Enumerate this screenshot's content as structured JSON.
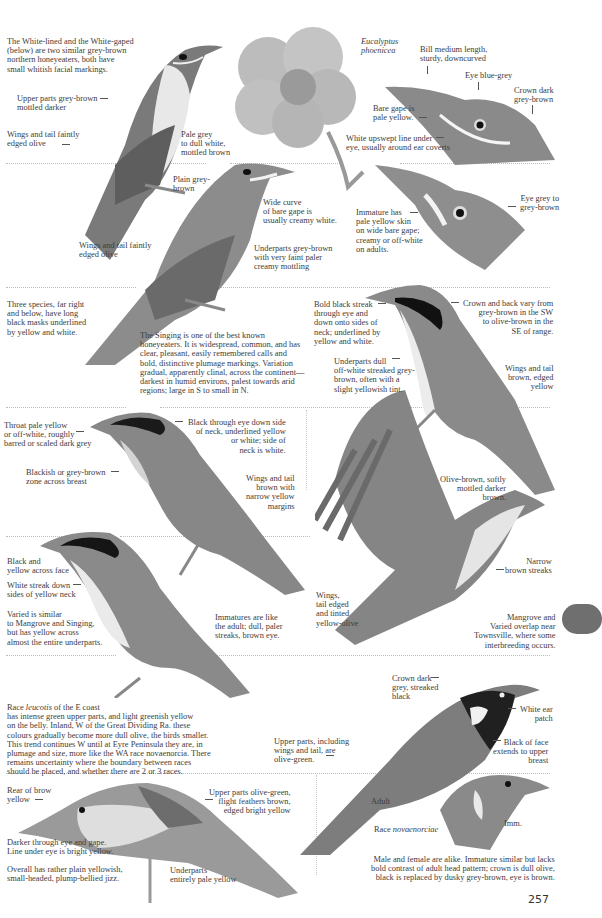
{
  "page": {
    "number": "257",
    "thumb_tab_color": "#6f6f6f"
  },
  "plant": {
    "label_genus": "Eucalyptus",
    "label_species": "phoenicea"
  },
  "white_lined": {
    "intro": "The White-lined and the White-gaped\n(below) are two similar grey-brown\nnorthern honeyeaters, both have\nsmall whitish facial markings.",
    "upperparts": "Upper parts grey-brown\nmottled darker",
    "wings": "Wings and tail faintly\nedged olive",
    "underparts": "Pale grey\nto dull white,\nmottled brown",
    "bill": "Bill medium length,\nsturdy, downcurved",
    "eye": "Eye blue-grey",
    "crown": "Crown dark\ngrey-brown",
    "gape": "Bare gape is\npale yellow.",
    "upswept": "White upswept line under\neye, usually around ear coverts"
  },
  "white_gaped": {
    "plain": "Plain grey-\nbrown",
    "gape_curve": "Wide curve\nof bare gape is\nusually creamy white.",
    "wings": "Wings and tail faintly\nedged olive",
    "underparts": "Underparts grey-brown\nwith very faint paler\ncreamy mottling",
    "immature": "Immature has\npale yellow skin\non wide bare gape;\ncreamy or off-white\non adults.",
    "eye": "Eye grey to\ngrey-brown"
  },
  "singing": {
    "three_species": "Three species, far right\nand below, have long\nblack masks underlined\nby yellow and white.",
    "description": "The Singing is one of the best known\nhoneyeaters.  It is widespread, common, and has\nclear, pleasant, easily remembered calls and\nbold, distinctive plumage markings.  Variation\ngradual, apparently clinal, across the continent—\ndarkest in humid environs, palest towards arid\nregions; large in S to small in N.",
    "streak": "Bold black streak\nthrough eye and\ndown onto sides of\nneck; underlined by\nyellow and white.",
    "crown_back": "Crown and back vary from\ngrey-brown in the SW\nto olive-brown in the\nSE of range.",
    "underparts": "Underparts dull\noff-white streaked grey-\nbrown, often with a\nslight yellowish tint.",
    "wings": "Wings and tail\nbrown, edged\nyellow"
  },
  "mangrove": {
    "throat": "Throat pale yellow\nor off-white, roughly\nbarred or scaled dark grey",
    "black_eye": "Black through eye down side\nof neck, underlined yellow\nor white; side of\nneck is white.",
    "breast": "Blackish or grey-brown\nzone across breast",
    "wings": "Wings and tail\nbrown with\nnarrow yellow\nmargins",
    "olive": "Olive-brown, softly\nmottled darker\nbrown.",
    "narrow": "Narrow\nbrown streaks",
    "wings_tinted": "Wings,\ntail edged\nand tinted\nyellow-olive",
    "overlap": "Mangrove and\nVaried overlap near\nTownsville, where some\ninterbreeding occurs."
  },
  "varied": {
    "face": "Black and\nyellow across face",
    "streak": "White streak down\nsides of yellow neck",
    "similar": "Varied is similar\nto Mangrove and Singing,\nbut has yellow across\nalmost the entire underparts.",
    "immatures": "Immatures are like\nthe adult; dull, paler\nstreaks, brown eye."
  },
  "purple_gaped": {
    "race_prefix": "Race ",
    "race_name": "leucotis",
    "race_suffix": " of the E coast",
    "race_text": "has intense green upper parts, and light greenish yellow\non the belly.  Inland, W of the Great Dividing Ra. these\ncolours gradually become more dull olive, the birds smaller.\nThis trend continues W until at Eyre Peninsula they are, in\nplumage and size, more like the WA race novaenorcia.  There\nremains uncertainty where the boundary between races\nshould be placed, and whether there are 2 or 3 races.",
    "crown": "Crown dark\ngrey, streaked\nblack",
    "ear": "White ear\npatch",
    "upperparts": "Upper parts, including\nwings and tail, are\nolive-green.",
    "face": "Black of face\nextends to upper\nbreast",
    "adult": "Adult",
    "race_label": "Race ",
    "race_label_name": "novaenorciae",
    "imm": "Imm.",
    "sexes": "Male and female are alike. Immature similar but lacks\nbold contrast of adult head pattern; crown is dull olive,\nblack is replaced by dusky grey-brown, eye is brown."
  },
  "yellow_faced": {
    "brow": "Rear of brow\nyellow",
    "upperparts": "Upper parts olive-green,\nflight feathers brown,\nedged bright yellow",
    "darker": "Darker through eye and gape.\nLine under eye is bright yellow.",
    "overall": "Overall has rather plain yellowish,\nsmall-headed, plump-bellied jizz.",
    "underparts": "Underparts\nentirely pale yellow"
  }
}
